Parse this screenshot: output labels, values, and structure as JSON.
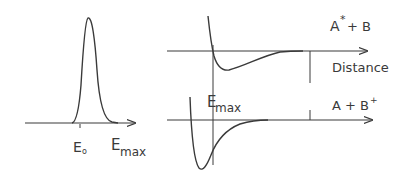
{
  "left_panel": {
    "description": "Energy distribution peak",
    "label_e0": "E",
    "label_e0_sub": "o",
    "label_emax": "E",
    "label_emax_sub": "max"
  },
  "right_panel": {
    "upper_state_label": "A",
    "upper_state_sup": "*",
    "upper_state_rest": "+ B",
    "axis_label": "Distance",
    "emax_label": "E",
    "emax_sub": "max",
    "lower_state_label": "A + B",
    "lower_state_sup": "+"
  },
  "colors": {
    "ink": "#3a3a3a",
    "background": "#ffffff"
  }
}
